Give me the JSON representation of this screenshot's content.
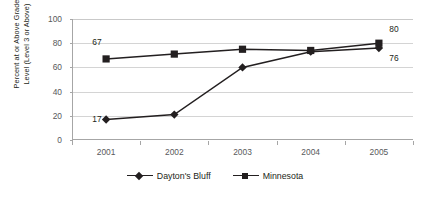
{
  "chart_data": {
    "type": "line",
    "title": "",
    "xlabel": "",
    "ylabel": "Percent at or Above Grade\nLevel (Level 3 or Above)",
    "categories": [
      "2001",
      "2002",
      "2003",
      "2004",
      "2005"
    ],
    "ylim": [
      0,
      100
    ],
    "ytick_values": [
      0,
      20,
      40,
      60,
      80,
      100
    ],
    "ytick_labels": [
      "0",
      "20",
      "40",
      "60",
      "80",
      "100"
    ],
    "grid": "horizontal",
    "legend_position": "bottom",
    "series": [
      {
        "name": "Dayton's Bluff",
        "marker": "diamond",
        "color": "#231f20",
        "values": [
          17,
          21,
          60,
          73,
          76
        ],
        "point_labels": [
          {
            "index": 0,
            "text": "17",
            "position": "left"
          },
          {
            "index": 4,
            "text": "76",
            "position": "below-right"
          }
        ]
      },
      {
        "name": "Minnesota",
        "marker": "square",
        "color": "#231f20",
        "values": [
          67,
          71,
          75,
          74,
          80
        ],
        "point_labels": [
          {
            "index": 0,
            "text": "67",
            "position": "left"
          },
          {
            "index": 4,
            "text": "80",
            "position": "above-right"
          }
        ]
      }
    ],
    "annotations": [
      {
        "text": "67",
        "series": "Minnesota",
        "category": "2001"
      },
      {
        "text": "17",
        "series": "Dayton's Bluff",
        "category": "2001"
      },
      {
        "text": "80",
        "series": "Minnesota",
        "category": "2005"
      },
      {
        "text": "76",
        "series": "Dayton's Bluff",
        "category": "2005"
      }
    ],
    "colors": {
      "series": "#231f20",
      "axis": "#a6a6a6",
      "grid": "#d4d4d4",
      "tick_text": "#58595b",
      "background": "#ffffff"
    }
  },
  "legend": {
    "items": [
      {
        "label": "Dayton's Bluff",
        "marker": "diamond"
      },
      {
        "label": "Minnesota",
        "marker": "square"
      }
    ]
  },
  "axes": {
    "y_title_line1": "Percent at or Above Grade",
    "y_title_line2": "Level (Level 3 or Above)",
    "y_ticks": [
      "100",
      "80",
      "60",
      "40",
      "20",
      "0"
    ],
    "x_ticks": [
      "2001",
      "2002",
      "2003",
      "2004",
      "2005"
    ]
  },
  "point_labels": {
    "mn_2001": "67",
    "db_2001": "17",
    "mn_2005": "80",
    "db_2005": "76"
  }
}
